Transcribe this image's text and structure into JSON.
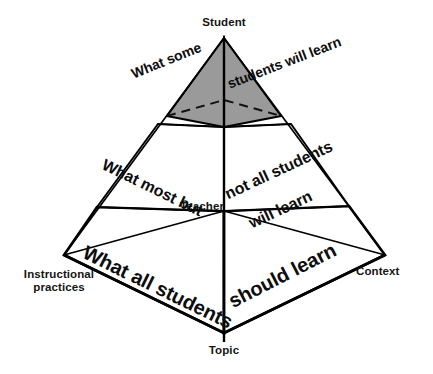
{
  "diagram": {
    "type": "3d-pyramid",
    "background_color": "#ffffff",
    "stroke_color": "#000000",
    "apex_fill_color": "#9a9a9a",
    "vertices": {
      "apex": "Student",
      "back": "Teacher",
      "left": "Instructional\npractices",
      "right": "Context",
      "front": "Topic"
    },
    "tiers": [
      {
        "id": "tier-top",
        "shaded": true,
        "fill": "#9a9a9a",
        "left_face_text": "What some",
        "right_face_text": "students will learn"
      },
      {
        "id": "tier-middle",
        "shaded": false,
        "fill": "#ffffff",
        "left_face_text": "What most but",
        "right_face_text_line1": "not all students",
        "right_face_text_line2": "will learn"
      },
      {
        "id": "tier-base",
        "shaded": false,
        "fill": "#ffffff",
        "left_face_text": "What all students",
        "right_face_text": "should learn"
      }
    ]
  }
}
